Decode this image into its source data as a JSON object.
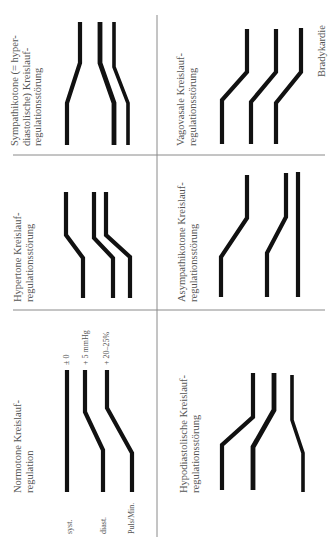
{
  "panels": {
    "sympathikotone": {
      "title_lines": [
        "Sympathikotone (= hyper-",
        "diastolische) Kreislauf-",
        "regulationsstörung"
      ]
    },
    "vagovasale": {
      "title_lines": [
        "Vagovasale Kreislauf-",
        "regulationsstörung"
      ],
      "annotation": "Bradykardie"
    },
    "hypertone": {
      "title_lines": [
        "Hypertone Kreislauf-",
        "regulationsstörung"
      ]
    },
    "asympathikotone": {
      "title_lines": [
        "Asympathikotone Kreislauf-",
        "regulationsstörung"
      ]
    },
    "normotone": {
      "title_lines": [
        "Normotone Kreislauf-",
        "regulation"
      ],
      "row_labels": [
        "syst.",
        "diast.",
        "Puls/Min."
      ],
      "change_labels": [
        "± 0",
        "+ 5 mmHg",
        "+ 20–25%"
      ]
    },
    "hypodiastolische": {
      "title_lines": [
        "Hypodiastolische Kreislauf-",
        "regulationsstörung"
      ]
    }
  },
  "colors": {
    "line": "#111111",
    "divider": "#8a8a8a",
    "text": "#555555"
  }
}
